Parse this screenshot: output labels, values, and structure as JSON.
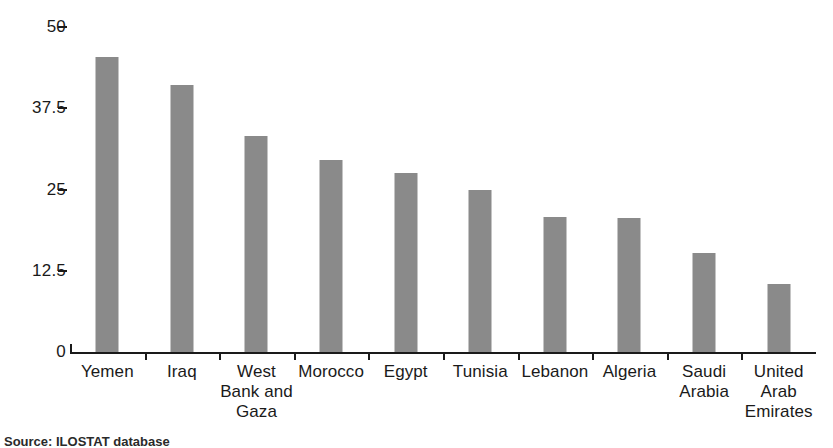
{
  "chart_data": {
    "type": "bar",
    "title": "",
    "subtitle": "",
    "xlabel": "",
    "ylabel": "",
    "categories": [
      "Yemen",
      "West Bank and Gaza",
      "Iraq",
      "Morocco",
      "Egypt",
      "Tunisia",
      "Lebanon",
      "Algeria",
      "Saudi Arabia",
      "United Arab Emirates"
    ],
    "category_labels": [
      "Yemen",
      "Iraq",
      "West Bank and Gaza",
      "Morocco",
      "Egypt",
      "Tunisia",
      "Lebanon",
      "Algeria",
      "Saudi Arabia",
      "United Arab Emirates"
    ],
    "values": [
      45.4,
      41.1,
      33.2,
      29.5,
      27.5,
      24.9,
      20.8,
      20.6,
      15.2,
      10.5
    ],
    "ylim": [
      0,
      50
    ],
    "yticks": [
      0,
      12.5,
      25,
      37.5,
      50
    ],
    "ytick_labels": [
      "0",
      "12.5",
      "25",
      "37.5",
      "50"
    ],
    "grid": false,
    "legend": false,
    "legend_position": "none",
    "bar_color": "#8a8a8a",
    "axis_color": "#1a1a1a",
    "background_color": "#ffffff"
  },
  "bars": [
    {
      "label": "Yemen",
      "label_lines": [
        "Yemen"
      ],
      "value": 45.4
    },
    {
      "label": "Iraq",
      "label_lines": [
        "Iraq"
      ],
      "value": 41.1
    },
    {
      "label": "West Bank and Gaza",
      "label_lines": [
        "West",
        "Bank and",
        "Gaza"
      ],
      "value": 33.2
    },
    {
      "label": "Morocco",
      "label_lines": [
        "Morocco"
      ],
      "value": 29.5
    },
    {
      "label": "Egypt",
      "label_lines": [
        "Egypt"
      ],
      "value": 27.5
    },
    {
      "label": "Tunisia",
      "label_lines": [
        "Tunisia"
      ],
      "value": 24.9
    },
    {
      "label": "Lebanon",
      "label_lines": [
        "Lebanon"
      ],
      "value": 20.8
    },
    {
      "label": "Algeria",
      "label_lines": [
        "Algeria"
      ],
      "value": 20.6
    },
    {
      "label": "Saudi Arabia",
      "label_lines": [
        "Saudi",
        "Arabia"
      ],
      "value": 15.2
    },
    {
      "label": "United Arab Emirates",
      "label_lines": [
        "United",
        "Arab",
        "Emirates"
      ],
      "value": 10.5
    }
  ],
  "source_note": "Source: ILOSTAT database"
}
